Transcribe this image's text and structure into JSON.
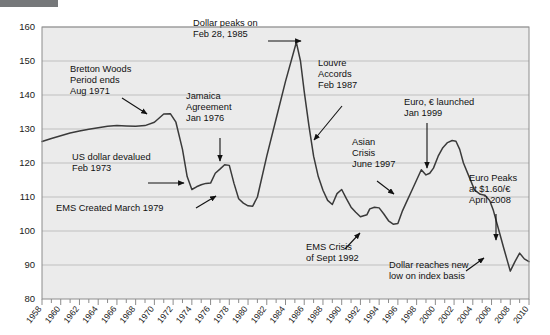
{
  "figure": {
    "redaction_bar": "",
    "background_color": "#ffffff",
    "plot_background_color": "#ebebeb",
    "line_color": "#3a3a3a",
    "grid_color": "#b4b4b4",
    "border_color": "#8c8c8c"
  },
  "chart_data": {
    "type": "line",
    "title": "",
    "xlabel": "",
    "ylabel": "",
    "xlim": [
      1958,
      2010
    ],
    "ylim": [
      80,
      160
    ],
    "grid": true,
    "legend": "none",
    "yticks": [
      80,
      90,
      100,
      110,
      120,
      130,
      140,
      150,
      160
    ],
    "xticks": [
      1958,
      1960,
      1962,
      1964,
      1966,
      1968,
      1970,
      1972,
      1974,
      1976,
      1978,
      1980,
      1982,
      1984,
      1986,
      1988,
      1990,
      1992,
      1994,
      1996,
      1998,
      2000,
      2002,
      2004,
      2006,
      2008,
      2010
    ],
    "xtick_labels": [
      "1958",
      "1960",
      "1962",
      "1964",
      "1966",
      "1968",
      "1970",
      "1972",
      "1974",
      "1976",
      "1978",
      "1980",
      "1982",
      "1984",
      "1986",
      "1988",
      "1990",
      "1992",
      "1994",
      "1996",
      "1998",
      "2000",
      "2002",
      "2004",
      "2006",
      "2008",
      "2010"
    ],
    "ytick_labels": [
      "80",
      "90",
      "100",
      "110",
      "120",
      "130",
      "140",
      "150",
      "160"
    ],
    "series": [
      {
        "name": "US dollar index",
        "x": [
          1958,
          1959,
          1960,
          1961,
          1962,
          1963,
          1964,
          1965,
          1966,
          1967,
          1968,
          1969,
          1970,
          1971,
          1971.7,
          1972.3,
          1973,
          1973.5,
          1974,
          1974.5,
          1975,
          1975.5,
          1976,
          1976.5,
          1977,
          1977.5,
          1978,
          1978.5,
          1979,
          1979.5,
          1980,
          1980.5,
          1981,
          1982,
          1983,
          1984,
          1985.16,
          1985.6,
          1986,
          1986.5,
          1987,
          1987.5,
          1988,
          1988.5,
          1989,
          1989.5,
          1990,
          1990.5,
          1991,
          1991.5,
          1992,
          1992.7,
          1993,
          1993.5,
          1994,
          1994.5,
          1995,
          1995.5,
          1996,
          1996.5,
          1997,
          1997.5,
          1998,
          1998.5,
          1999,
          1999.4,
          1999.8,
          2000.3,
          2000.8,
          2001.3,
          2001.8,
          2002.2,
          2002.6,
          2003,
          2003.6,
          2004.2,
          2004.8,
          2005.3,
          2005.8,
          2006.2,
          2006.8,
          2007.3,
          2008.0,
          2008.5,
          2009.0,
          2009.5,
          2010
        ],
        "y": [
          126.3,
          127.2,
          128.0,
          128.8,
          129.4,
          129.9,
          130.4,
          130.8,
          131.0,
          130.9,
          130.8,
          131.0,
          132.0,
          134.4,
          134.5,
          132.0,
          124.0,
          116.0,
          112.2,
          113.0,
          113.6,
          114.0,
          114.1,
          117.0,
          118.2,
          119.5,
          119.3,
          114.0,
          109.5,
          108.2,
          107.4,
          107.3,
          110.0,
          122.0,
          133.0,
          144.0,
          155.5,
          150.0,
          141.0,
          131.0,
          122.0,
          116.0,
          112.0,
          109.0,
          107.8,
          111.0,
          112.2,
          109.5,
          107.0,
          105.5,
          104.2,
          104.8,
          106.5,
          107.0,
          106.8,
          105.0,
          103.0,
          102.0,
          102.2,
          106.0,
          109.0,
          112.0,
          115.0,
          118.0,
          116.5,
          117.0,
          118.5,
          122.0,
          124.5,
          126.0,
          126.6,
          126.4,
          124.0,
          120.0,
          116.0,
          112.0,
          110.8,
          110.5,
          109.0,
          106.0,
          100.0,
          95.0,
          88.2,
          91.0,
          93.5,
          91.8,
          91.0
        ],
        "note": "Major US dollar index, 1958-2010, annotated with key monetary-system events"
      }
    ],
    "annotations": [
      {
        "id": "dollar-peak-1985",
        "text": [
          "Dollar peaks on",
          "Feb 28, 1985"
        ],
        "text_x": 193,
        "text_y": 26,
        "arrow": {
          "x1": 268,
          "y1": 41,
          "x2": 301,
          "y2": 41
        },
        "align": "start"
      },
      {
        "id": "bretton-woods",
        "text": [
          "Bretton Woods",
          "Period ends",
          "Aug 1971"
        ],
        "text_x": 70,
        "text_y": 72,
        "arrow": {
          "x1": 122,
          "y1": 98,
          "x2": 147,
          "y2": 114
        },
        "align": "start"
      },
      {
        "id": "jamaica-agreement",
        "text": [
          "Jamaica",
          "Agreement",
          "Jan 1976"
        ],
        "text_x": 186,
        "text_y": 99,
        "arrow": {
          "x1": 220,
          "y1": 138,
          "x2": 220,
          "y2": 161
        },
        "align": "start"
      },
      {
        "id": "louvre-accords",
        "text": [
          "Louvre",
          "Accords",
          "Feb 1987"
        ],
        "text_x": 318,
        "text_y": 66,
        "arrow": {
          "x1": 342,
          "y1": 106,
          "x2": 314,
          "y2": 140
        },
        "align": "start"
      },
      {
        "id": "euro-launched",
        "text": [
          "Euro, € launched",
          "Jan 1999"
        ],
        "text_x": 404,
        "text_y": 105,
        "arrow": {
          "x1": 427,
          "y1": 123,
          "x2": 427,
          "y2": 168
        },
        "align": "start"
      },
      {
        "id": "us-dollar-devalued",
        "text": [
          "US dollar devalued",
          "Feb 1973"
        ],
        "text_x": 72,
        "text_y": 160,
        "arrow": {
          "x1": 148,
          "y1": 183,
          "x2": 184,
          "y2": 183
        },
        "align": "start"
      },
      {
        "id": "asian-crisis",
        "text": [
          "Asian",
          "Crisis",
          "June 1997"
        ],
        "text_x": 352,
        "text_y": 145,
        "arrow": {
          "x1": 377,
          "y1": 181,
          "x2": 394,
          "y2": 194
        },
        "align": "start"
      },
      {
        "id": "ems-created",
        "text": [
          "EMS Created March 1979"
        ],
        "text_x": 56,
        "text_y": 211,
        "arrow": {
          "x1": 196,
          "y1": 208,
          "x2": 216,
          "y2": 196
        },
        "align": "start"
      },
      {
        "id": "euro-peaks",
        "text": [
          "Euro Peaks",
          "at $1.60/€",
          "April 2008"
        ],
        "text_x": 469,
        "text_y": 181,
        "arrow": {
          "x1": 496,
          "y1": 214,
          "x2": 496,
          "y2": 240
        },
        "align": "start"
      },
      {
        "id": "ems-crisis",
        "text": [
          "EMS Crisis",
          "of Sept 1992"
        ],
        "text_x": 306,
        "text_y": 250,
        "arrow": {
          "x1": 345,
          "y1": 249,
          "x2": 360,
          "y2": 233
        },
        "align": "start"
      },
      {
        "id": "dollar-new-low",
        "text": [
          "Dollar reaches new",
          "low on index basis"
        ],
        "text_x": 389,
        "text_y": 268,
        "arrow": {
          "x1": 466,
          "y1": 271,
          "x2": 484,
          "y2": 258
        },
        "align": "start"
      }
    ]
  }
}
